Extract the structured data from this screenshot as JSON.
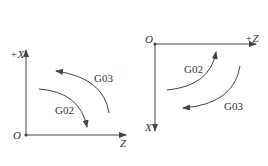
{
  "left_diagram": {
    "origin_label": "O",
    "vertical_axis_label": "+X",
    "horizontal_axis_label": "Z",
    "outer_arc_label": "G03",
    "inner_arc_label": "G02"
  },
  "right_diagram": {
    "origin_label": "O",
    "horizontal_axis_label": "+Z",
    "vertical_axis_label": "X",
    "upper_arc_label": "G02",
    "lower_arc_label": "G03"
  },
  "colors": {
    "line": "#444444",
    "text": "#333333"
  }
}
